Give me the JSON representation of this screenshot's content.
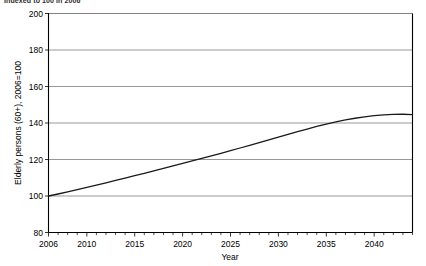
{
  "clipped_header": "Indexed to 100 in 2006",
  "chart_data": {
    "type": "line",
    "title": "",
    "xlabel": "Year",
    "ylabel": "Elderly persons (60+), 2006=100",
    "xlim": [
      2006,
      2044
    ],
    "ylim": [
      80,
      200
    ],
    "yticks": [
      80,
      100,
      120,
      140,
      160,
      180,
      200
    ],
    "xticks": [
      2006,
      2010,
      2015,
      2020,
      2025,
      2030,
      2035,
      2040
    ],
    "xtick_labels": [
      "2006",
      "2010",
      "2015",
      "2020",
      "2025",
      "2030",
      "2035",
      "2040"
    ],
    "ytick_labels": [
      "80",
      "100",
      "120",
      "140",
      "160",
      "180",
      "200"
    ],
    "grid": "horizontal",
    "legend": "none",
    "minor_tick_interval": 1,
    "line_color": "#1a1a1a",
    "grid_color": "#7d7d7d",
    "series": [
      {
        "name": "Elderly persons (60+) index",
        "x": [
          2006,
          2007,
          2008,
          2009,
          2010,
          2011,
          2012,
          2013,
          2014,
          2015,
          2016,
          2017,
          2018,
          2019,
          2020,
          2021,
          2022,
          2023,
          2024,
          2025,
          2026,
          2027,
          2028,
          2029,
          2030,
          2031,
          2032,
          2033,
          2034,
          2035,
          2036,
          2037,
          2038,
          2039,
          2040,
          2041,
          2042,
          2043,
          2044
        ],
        "values": [
          100.0,
          101.1,
          102.3,
          103.5,
          104.7,
          105.9,
          107.2,
          108.5,
          109.8,
          111.1,
          112.4,
          113.8,
          115.1,
          116.5,
          117.9,
          119.2,
          120.6,
          122.0,
          123.4,
          124.8,
          126.3,
          127.8,
          129.3,
          130.8,
          132.3,
          133.8,
          135.3,
          136.7,
          138.1,
          139.4,
          140.6,
          141.7,
          142.6,
          143.4,
          144.0,
          144.4,
          144.7,
          144.8,
          144.6
        ]
      }
    ]
  }
}
